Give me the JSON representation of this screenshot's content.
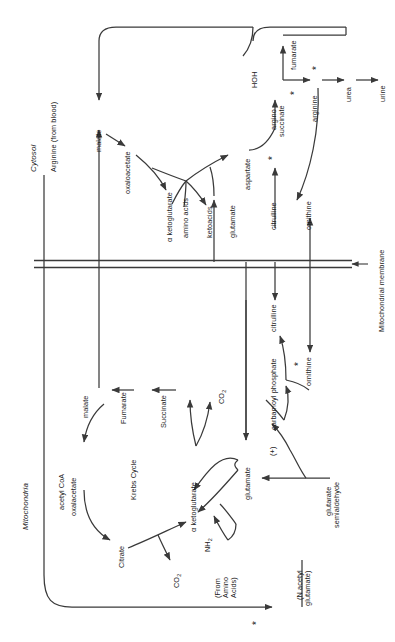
{
  "diagram": {
    "type": "biochemical-pathway",
    "orientation": "text rotated 90 degrees counter-clockwise",
    "compartments": {
      "cytosol_label": "Cytosol",
      "mitochondria_label": "Mitochondria",
      "membrane_label": "Mitochondrial membrane"
    },
    "metabolites": {
      "arginine_from_blood": "Arginine (from blood)",
      "malate_cytosol": "malate",
      "oxaloacetate_cytosol": "oxaloacetate",
      "alpha_ketoglutarate_cytosol": "α ketoglutarate",
      "amino_acids": "amino acids",
      "ketoacids": "ketoacids",
      "glutamate_cytosol": "glutamate",
      "aspartate": "aspartate",
      "hoh": "HOH",
      "fumarate_cytosol": "fumarate",
      "argino_succinate_line1": "argino",
      "argino_succinate_line2": "succinate",
      "arginine": "arginine",
      "urea": "urea",
      "urine": "urine",
      "citrulline_cytosol": "citrulline",
      "ornithine_cytosol": "ornithine",
      "citrulline_mito": "citrulline",
      "ornithine_mito": "ornithine",
      "carbamoyl_phosphate": "carbamoyl phosphate",
      "plus_sign": "(+)",
      "glutamate_mito": "glutamate",
      "glutarate_semialdehyde_line1": "glutarate",
      "glutarate_semialdehyde_line2": "semialdehyde",
      "n_acetyl_glutamate_line1": "(N acetyl",
      "n_acetyl_glutamate_line2": "glutamate)",
      "acetyl_coa": "acetyl CoA",
      "oxalacetate_mito": "oxalacetate",
      "malate_mito": "malate",
      "fumarate_mito": "Fumarate",
      "succinate_mito": "Succinate",
      "krebs_cycle": "Krebs Cycle",
      "citrate": "Citrate",
      "alpha_ketoglutarate_mito": "α ketoglutarate",
      "co2_a": "CO2",
      "co2_b": "CO2",
      "co2_c": "CO2",
      "nh2": "NH2",
      "from_amino_acids_line1": "(From",
      "from_amino_acids_line2": "Amino",
      "from_amino_acids_line3": "Acids)"
    },
    "markers": {
      "enzyme_star": "*",
      "star_count": 6,
      "star_note": "asterisks mark enzymatic steps"
    },
    "colors": {
      "line": "#3a3a3a",
      "text": "#1a1a1a",
      "background": "#ffffff"
    }
  }
}
